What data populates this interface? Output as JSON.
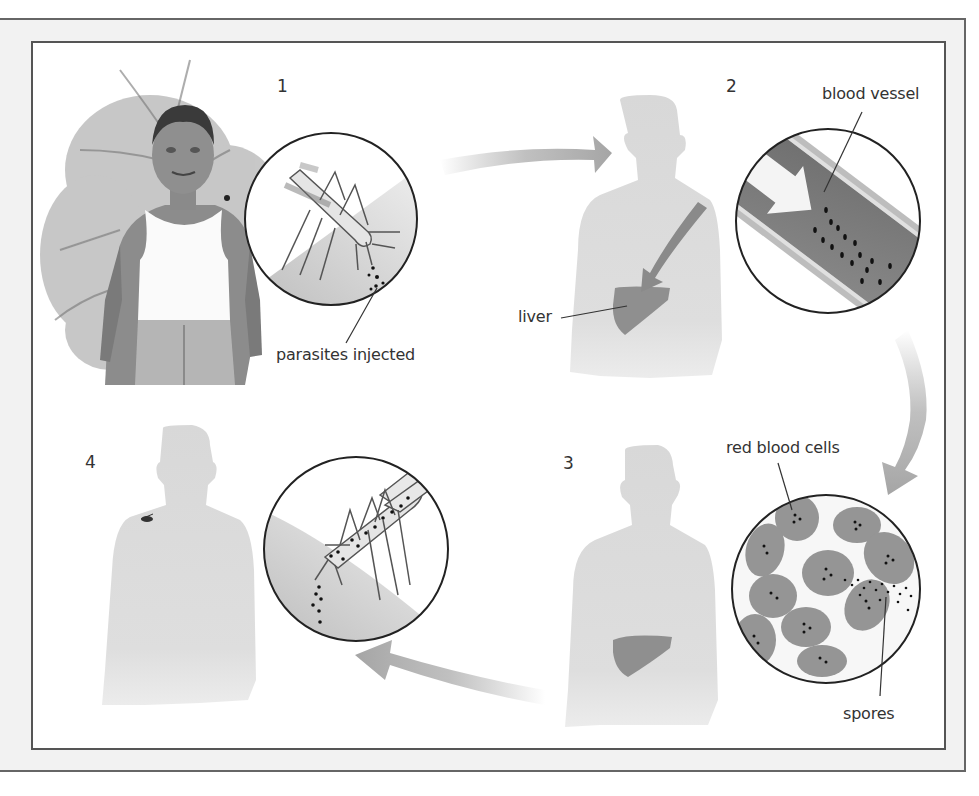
{
  "diagram": {
    "steps": [
      {
        "number": "1",
        "label": "parasites injected"
      },
      {
        "number": "2",
        "labels": [
          "blood vessel",
          "liver"
        ]
      },
      {
        "number": "3",
        "labels": [
          "red blood cells",
          "spores"
        ]
      },
      {
        "number": "4"
      }
    ],
    "colors": {
      "frame_bg": "#f2f2f2",
      "frame_line": "#555555",
      "silhouette": "#d9d9d9",
      "arrow": "#a9a9a9",
      "organ": "#8c8c8c",
      "vessel": "#7f7f7f",
      "cell": "#9a9a9a",
      "text": "#333333"
    },
    "icons": [
      "mosquito-icon",
      "person-silhouette-icon",
      "liver-icon",
      "blood-vessel-icon",
      "red-blood-cell-icon",
      "cycle-arrow-icon"
    ]
  }
}
